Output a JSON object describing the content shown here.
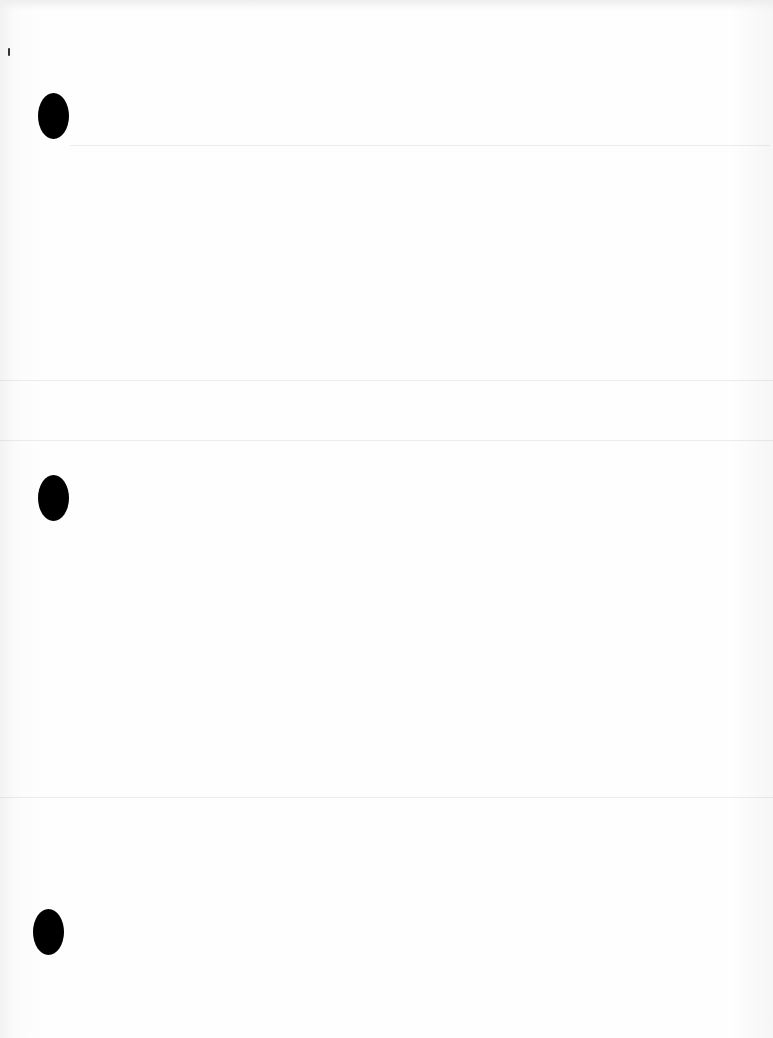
{
  "document": {
    "type": "blank scanned page",
    "punch_holes": [
      {
        "x": 38,
        "y": 93
      },
      {
        "x": 38,
        "y": 475
      },
      {
        "x": 33,
        "y": 909
      }
    ],
    "colors": {
      "paper": "#fdfdfd",
      "hole": "#000000"
    }
  }
}
